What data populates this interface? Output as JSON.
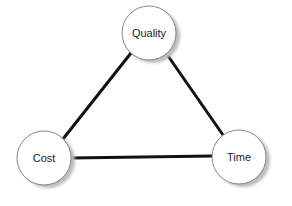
{
  "diagram": {
    "title": "",
    "nodes": [
      {
        "id": "quality",
        "label": "Quality",
        "cx": 149,
        "cy": 33,
        "r": 27
      },
      {
        "id": "cost",
        "label": "Cost",
        "cx": 44,
        "cy": 158,
        "r": 27
      },
      {
        "id": "time",
        "label": "Time",
        "cx": 239,
        "cy": 157,
        "r": 27
      }
    ],
    "edges": [
      {
        "from": "quality",
        "to": "cost"
      },
      {
        "from": "quality",
        "to": "time"
      },
      {
        "from": "cost",
        "to": "time"
      }
    ],
    "colors": {
      "edge": "#111111",
      "node_fill": "#ffffff",
      "node_stroke": "#888888",
      "shadow": "#bbbbbb"
    }
  }
}
